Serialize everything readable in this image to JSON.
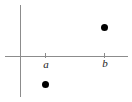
{
  "figure": {
    "width": 132,
    "height": 102,
    "background_color": "#ffffff",
    "axis_color": "#8c8c8c",
    "point_color": "#000000",
    "label_color": "#1a1a1a"
  },
  "axes": {
    "horizontal": {
      "name": "x-axis",
      "y": 57,
      "x_start": 5,
      "x_end": 128
    },
    "vertical": {
      "name": "y-axis",
      "x": 21,
      "y_start": 5,
      "y_end": 97
    },
    "origin": {
      "x": 21,
      "y": 57
    }
  },
  "ticks": [
    {
      "label": "a",
      "x": 45.5,
      "style": "italic"
    },
    {
      "label": "b",
      "x": 104.5,
      "style": "italic"
    }
  ],
  "chart_data": {
    "type": "scatter",
    "title": "",
    "xlabel": "",
    "ylabel": "",
    "grid": false,
    "legend": null,
    "xtick_labels": [
      "a",
      "b"
    ],
    "xtick_positions_px": [
      45.5,
      104.5
    ],
    "ytick_labels": [],
    "x": [
      "a",
      "b"
    ],
    "points": [
      {
        "label": "",
        "x_tick": "b",
        "x_px": 104.5,
        "y_px": 27.5,
        "sign": "above-axis",
        "marker": "filled-circle"
      },
      {
        "label": "",
        "x_tick": "a",
        "x_px": 45.5,
        "y_px": 84.5,
        "sign": "below-axis",
        "marker": "filled-circle"
      }
    ],
    "annotations": []
  }
}
